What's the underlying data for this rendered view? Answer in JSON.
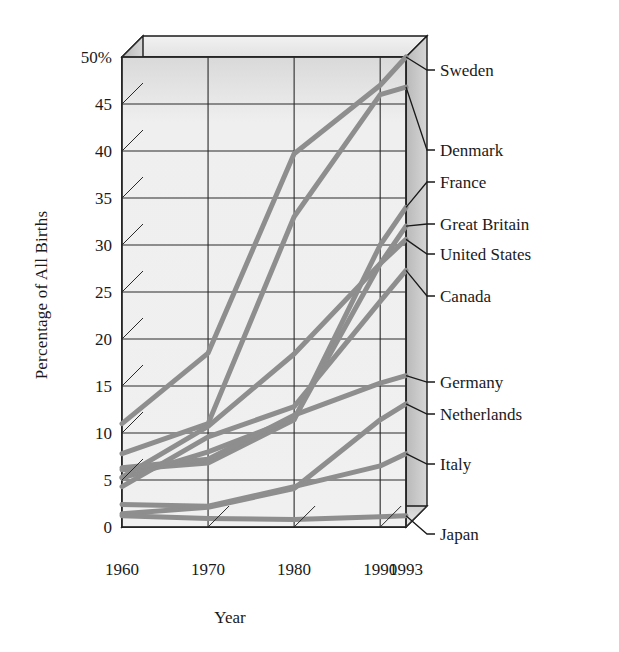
{
  "chart_data": {
    "type": "line",
    "title": "",
    "xlabel": "Year",
    "ylabel": "Percentage of All Births",
    "x": [
      1960,
      1970,
      1980,
      1990,
      1993
    ],
    "xlim": [
      1960,
      1993
    ],
    "ylim": [
      0,
      50
    ],
    "yticks": [
      0,
      5,
      10,
      15,
      20,
      25,
      30,
      35,
      40,
      45,
      50
    ],
    "ytick_labels": [
      "0",
      "5",
      "10",
      "15",
      "20",
      "25",
      "30",
      "35",
      "40",
      "45",
      "50%"
    ],
    "xtick_labels": [
      "1960",
      "1970",
      "1980",
      "1990",
      "1993"
    ],
    "grid": true,
    "legend_position": "right-inline-labels",
    "style": "3d-box",
    "line_color": "#8e8e8e",
    "series": [
      {
        "name": "Sweden",
        "values": [
          11.0,
          18.5,
          39.7,
          47.0,
          50.0
        ]
      },
      {
        "name": "Denmark",
        "values": [
          7.8,
          11.0,
          33.0,
          46.0,
          46.8
        ]
      },
      {
        "name": "France",
        "values": [
          6.1,
          6.8,
          11.4,
          30.0,
          34.0
        ]
      },
      {
        "name": "Great Britain",
        "values": [
          5.2,
          8.0,
          11.5,
          28.0,
          32.0
        ]
      },
      {
        "name": "United States",
        "values": [
          5.3,
          10.7,
          18.4,
          28.0,
          30.6
        ]
      },
      {
        "name": "Canada",
        "values": [
          4.3,
          9.6,
          12.8,
          24.0,
          27.3
        ]
      },
      {
        "name": "Germany",
        "values": [
          6.3,
          7.2,
          11.9,
          15.3,
          16.1
        ]
      },
      {
        "name": "Netherlands",
        "values": [
          1.4,
          2.1,
          4.1,
          11.4,
          13.1
        ]
      },
      {
        "name": "Italy",
        "values": [
          2.4,
          2.2,
          4.3,
          6.5,
          7.8
        ]
      },
      {
        "name": "Japan",
        "values": [
          1.2,
          0.9,
          0.8,
          1.1,
          1.2
        ]
      }
    ]
  },
  "axis": {
    "y_title": "Percentage of All Births",
    "x_title": "Year"
  }
}
